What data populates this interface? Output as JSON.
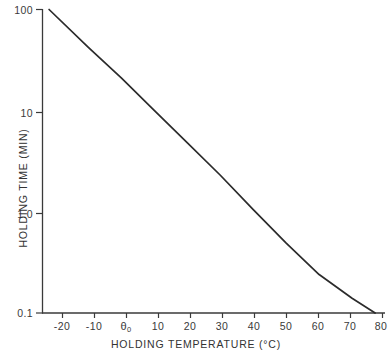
{
  "chart_data": {
    "type": "line",
    "title": "",
    "xlabel": "HOLDING TEMPERATURE (°C)",
    "ylabel": "HOLDING TIME (MIN)",
    "yscale": "log",
    "xscale": "linear",
    "xlim": [
      -24,
      80
    ],
    "ylim": [
      0.1,
      100
    ],
    "grid": false,
    "legend": null,
    "x_ticks": [
      {
        "value": -20,
        "label": "-20"
      },
      {
        "value": -10,
        "label": "-10"
      },
      {
        "value": 0,
        "label": "θ0"
      },
      {
        "value": 10,
        "label": "10"
      },
      {
        "value": 20,
        "label": "20"
      },
      {
        "value": 30,
        "label": "30"
      },
      {
        "value": 40,
        "label": "40"
      },
      {
        "value": 50,
        "label": "50"
      },
      {
        "value": 60,
        "label": "60"
      },
      {
        "value": 70,
        "label": "70"
      },
      {
        "value": 80,
        "label": "80"
      }
    ],
    "y_ticks": [
      {
        "value": 100,
        "label": "100"
      },
      {
        "value": 10,
        "label": "10"
      },
      {
        "value": 1.0,
        "label": "1.0"
      },
      {
        "value": 0.1,
        "label": "0.1"
      }
    ],
    "series": [
      {
        "name": "holding time",
        "color": "#2b2b2b",
        "points": [
          {
            "x": -22,
            "y": 100
          },
          {
            "x": -10,
            "y": 42
          },
          {
            "x": 0,
            "y": 21
          },
          {
            "x": 10,
            "y": 10
          },
          {
            "x": 20,
            "y": 4.8
          },
          {
            "x": 30,
            "y": 2.3
          },
          {
            "x": 40,
            "y": 1.05
          },
          {
            "x": 50,
            "y": 0.49
          },
          {
            "x": 60,
            "y": 0.24
          },
          {
            "x": 70,
            "y": 0.14
          },
          {
            "x": 77,
            "y": 0.1
          }
        ]
      }
    ]
  },
  "axis_titles": {
    "x": "HOLDING  TEMPERATURE (°C)",
    "y": "HOLDING  TIME  (MIN)"
  },
  "x_tick_text": {
    "t0": "-20",
    "t1": "-10",
    "t2": "θ",
    "t2sub": "0",
    "t3": "10",
    "t4": "20",
    "t5": "30",
    "t6": "40",
    "t7": "50",
    "t8": "60",
    "t9": "70",
    "t10": "80"
  },
  "y_tick_text": {
    "t0": "100",
    "t1": "10",
    "t2": "1.0",
    "t3": "0.1"
  }
}
